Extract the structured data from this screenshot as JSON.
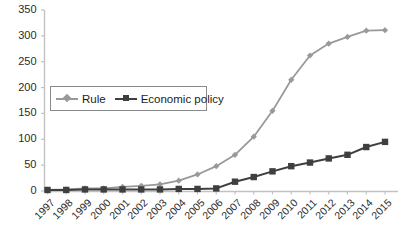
{
  "chart_data": {
    "type": "line",
    "title": "",
    "subtitle": "",
    "xlabel": "",
    "ylabel": "",
    "categories": [
      "1997",
      "1998",
      "1999",
      "2000",
      "2001",
      "2002",
      "2003",
      "2004",
      "2005",
      "2006",
      "2007",
      "2008",
      "2009",
      "2010",
      "2011",
      "2012",
      "2013",
      "2014",
      "2015"
    ],
    "yticks": [
      0,
      50,
      100,
      150,
      200,
      250,
      300,
      350
    ],
    "ylim": [
      0,
      350
    ],
    "grid": false,
    "legend_position": "upper-left-inside",
    "series": [
      {
        "name": "Rule",
        "color": "#999999",
        "marker": "diamond",
        "values": [
          2,
          3,
          5,
          5,
          8,
          10,
          13,
          20,
          32,
          48,
          70,
          105,
          155,
          215,
          262,
          285,
          298,
          310,
          311
        ]
      },
      {
        "name": "Economic policy",
        "color": "#3f3f3f",
        "marker": "square",
        "values": [
          2,
          2,
          3,
          3,
          3,
          3,
          3,
          4,
          4,
          5,
          18,
          27,
          38,
          48,
          55,
          63,
          70,
          85,
          95
        ]
      }
    ]
  },
  "legend": {
    "entries": [
      {
        "label": "Rule"
      },
      {
        "label": "Economic policy"
      }
    ]
  },
  "axes": {
    "y_axis_color": "#bfbfbf",
    "x_axis_color": "#bfbfbf"
  }
}
